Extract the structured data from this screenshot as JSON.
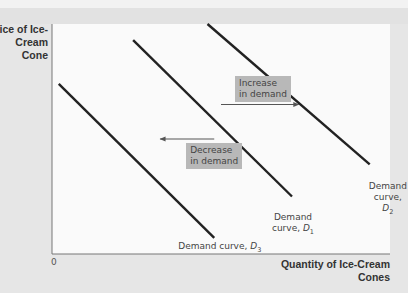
{
  "chart_data": {
    "type": "line",
    "title": "",
    "ylabel": "Price of Ice-Cream Cone",
    "xlabel": "Quantity of Ice-Cream Cones",
    "origin_label": "0",
    "xlim": [
      0,
      100
    ],
    "ylim": [
      0,
      100
    ],
    "grid": false,
    "series": [
      {
        "name": "Demand curve, D3",
        "label_prefix": "Demand curve, ",
        "label_var": "D",
        "label_sub": "3",
        "x": [
          2,
          48
        ],
        "y": [
          74,
          7
        ]
      },
      {
        "name": "Demand curve, D1",
        "label_prefix": "Demand curve, ",
        "label_var": "D",
        "label_sub": "1",
        "x": [
          24,
          71
        ],
        "y": [
          93,
          25
        ]
      },
      {
        "name": "Demand curve, D2",
        "label_prefix": "Demand curve, ",
        "label_var": "D",
        "label_sub": "2",
        "x": [
          46,
          94
        ],
        "y": [
          100,
          39
        ]
      }
    ],
    "annotations": [
      {
        "text_line1": "Increase",
        "text_line2": "in demand",
        "arrow_from": [
          50,
          65
        ],
        "arrow_to": [
          73,
          65
        ],
        "direction": "right"
      },
      {
        "text_line1": "Decrease",
        "text_line2": "in demand",
        "arrow_from": [
          48,
          50
        ],
        "arrow_to": [
          32,
          50
        ],
        "direction": "left"
      }
    ]
  },
  "colors": {
    "curve": "#222222",
    "arrow": "#555555",
    "annotation_box": "#b8b8b8",
    "plot_background": "#fafafa",
    "page_background": "#e6e6e6"
  }
}
